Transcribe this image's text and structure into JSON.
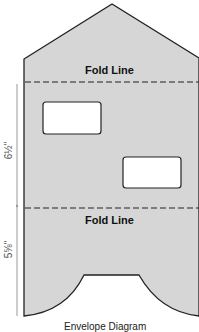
{
  "diagram": {
    "fold_line_top": "Fold Line",
    "fold_line_bottom": "Fold Line",
    "dimension_upper": "6½\"",
    "dimension_lower": "5⅝\"",
    "caption": "Envelope Diagram"
  },
  "colors": {
    "paper_fill": "#d6d6d6",
    "outline": "#222222",
    "window_fill": "#ffffff"
  }
}
